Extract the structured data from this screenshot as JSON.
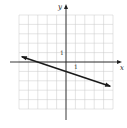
{
  "chart_data": {
    "type": "line",
    "title": "",
    "xlabel": "x",
    "ylabel": "y",
    "xlim": [
      -5,
      5
    ],
    "ylim": [
      -5,
      5
    ],
    "grid": true,
    "tick_labels": {
      "x": "1",
      "y": "1"
    },
    "series": [
      {
        "name": "line",
        "equation": "y = -x/3 - 1",
        "slope": -0.3333,
        "y_intercept": -1,
        "x": [
          -4.7,
          0,
          4.7
        ],
        "y": [
          0.57,
          -1,
          -2.57
        ],
        "arrows_both_ends": true
      }
    ]
  },
  "axes": {
    "x_label": "x",
    "y_label": "y",
    "x_tick": "1",
    "y_tick": "1"
  },
  "colors": {
    "grid": "#c8c8c8",
    "axis": "#222222",
    "line": "#1a1a1a"
  }
}
